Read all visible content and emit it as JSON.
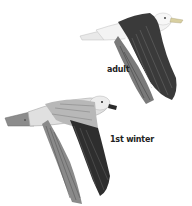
{
  "figure": {
    "birds": [
      {
        "id": "adult",
        "label": "adult"
      },
      {
        "id": "first-winter",
        "label": "1st winter"
      }
    ]
  },
  "colors": {
    "background": "#ffffff",
    "label_text": "#222222",
    "adult_mantle": "#3a3a3a",
    "adult_body": "#f2f2f2",
    "juvenile_covert": "#b8b8b8",
    "juvenile_primary": "#2e2e2e",
    "bill_yellow": "#d8cfa0"
  }
}
